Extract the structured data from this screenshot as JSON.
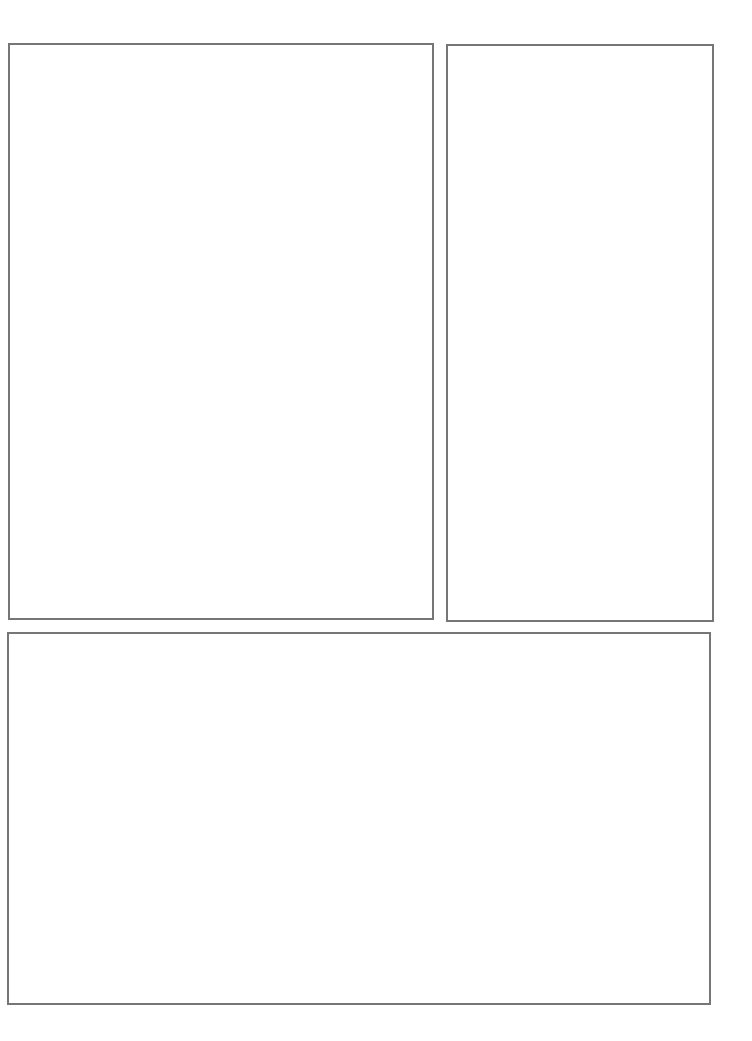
{
  "page": {
    "type": "blank comic panel layout",
    "background_color": "#ffffff",
    "border_color": "#767676",
    "panels": [
      {
        "id": "panel-1",
        "position": "top-left",
        "content": ""
      },
      {
        "id": "panel-2",
        "position": "top-right",
        "content": ""
      },
      {
        "id": "panel-3",
        "position": "bottom",
        "content": ""
      }
    ]
  }
}
